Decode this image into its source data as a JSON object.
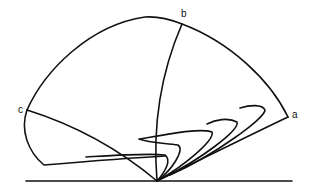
{
  "diagram": {
    "labels": {
      "a": "a",
      "b": "b",
      "c": "c"
    },
    "stroke_color": "#111111",
    "background": "#ffffff"
  }
}
